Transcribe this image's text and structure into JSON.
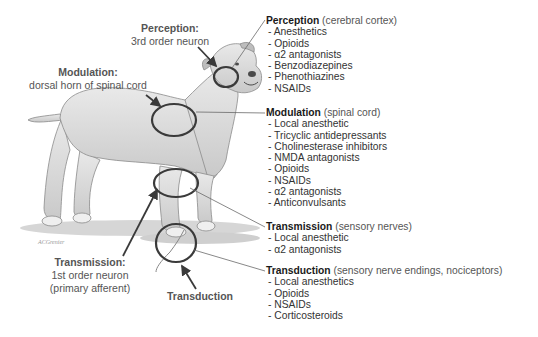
{
  "diagram": {
    "left_labels": {
      "perception": {
        "title": "Perception:",
        "subtitle": "3rd order neuron"
      },
      "modulation": {
        "title": "Modulation:",
        "subtitle": "dorsal horn of spinal cord"
      },
      "transmission": {
        "title": "Transmission:",
        "subtitle_1": "1st order neuron",
        "subtitle_2": "(primary afferent)"
      },
      "transduction": {
        "title": "Transduction"
      }
    },
    "drug_blocks": [
      {
        "heading": "Perception",
        "site": "(cerebral cortex)",
        "items": [
          "- Anesthetics",
          "- Opioids",
          "- α2 antagonists",
          "- Benzodiazepines",
          "- Phenothiazines",
          "- NSAIDs"
        ]
      },
      {
        "heading": "Modulation",
        "site": "(spinal cord)",
        "items": [
          "- Local anesthetic",
          "- Tricyclic antidepressants",
          "- Cholinesterase inhibitors",
          "- NMDA antagonists",
          "- Opioids",
          "- NSAIDs",
          "- α2 antagonists",
          "- Anticonvulsants"
        ]
      },
      {
        "heading": "Transmission",
        "site": "(sensory nerves)",
        "items": [
          "- Local anesthetic",
          "- α2 antagonists"
        ]
      },
      {
        "heading": "Transduction",
        "site": "(sensory nerve endings, nociceptors)",
        "items": [
          "- Local anesthetics",
          "- Opioids",
          "- NSAIDs",
          "- Corticosteroids"
        ]
      }
    ],
    "artist_signature": "ACGrenier",
    "colors": {
      "outline": "#3a3a3a",
      "text": "#333333",
      "label": "#555555"
    }
  }
}
